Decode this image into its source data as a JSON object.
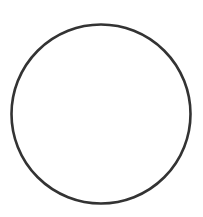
{
  "canvas": {
    "width": 203,
    "height": 217,
    "background": "#ffffff"
  },
  "shape": {
    "type": "circle",
    "cx": 101,
    "cy": 114,
    "r": 89.5,
    "stroke": "#333333",
    "stroke_width": 2.6,
    "fill": "none"
  }
}
